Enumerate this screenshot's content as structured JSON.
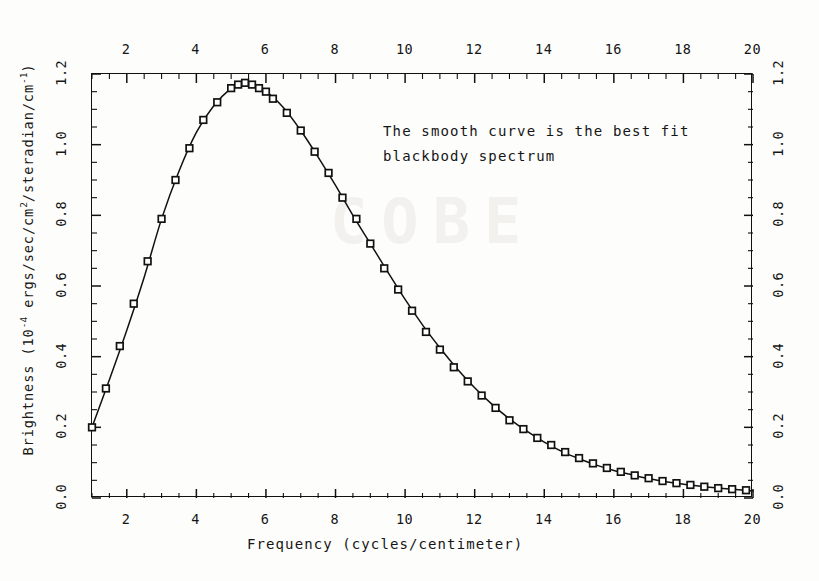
{
  "figure": {
    "xlabel": "Frequency (cycles/centimeter)",
    "ylabel_prefix": "Brightness (10",
    "ylabel_exp1": "-4",
    "ylabel_mid": " ergs/sec/cm",
    "ylabel_exp2": "2",
    "ylabel_mid2": "/steradian/cm",
    "ylabel_exp3": "-1",
    "ylabel_suffix": ")",
    "ylabel_plain": "Brightness (10⁻⁴ ergs/sec/cm²/steradian/cm⁻¹)",
    "annotation_line1": "The smooth curve is the best fit",
    "annotation_line2": "blackbody spectrum",
    "annotation_full": "The smooth curve is the best fit\nblackbody spectrum",
    "watermark": "COBE"
  },
  "chart_data": {
    "type": "line",
    "title": "",
    "subtitle": "",
    "xlabel": "Frequency (cycles/centimeter)",
    "ylabel": "Brightness (10^-4 ergs/sec/cm^2/steradian/cm^-1)",
    "xlim": [
      1,
      20
    ],
    "ylim": [
      0.0,
      1.2
    ],
    "grid": false,
    "legend": "none",
    "annotations": [
      {
        "text": "The smooth curve is the best fit blackbody spectrum",
        "x": 9.4,
        "y": 1.06
      }
    ],
    "axes": {
      "bottom": {
        "major_ticks": [
          2,
          4,
          6,
          8,
          10,
          12,
          14,
          16,
          18,
          20
        ],
        "tick_labels": [
          "2",
          "4",
          "6",
          "8",
          "10",
          "12",
          "14",
          "16",
          "18",
          "20"
        ],
        "minor_tick_step": 0.5,
        "labels_position": "below"
      },
      "top": {
        "major_ticks": [
          2,
          4,
          6,
          8,
          10,
          12,
          14,
          16,
          18,
          20
        ],
        "tick_labels": [
          "2",
          "4",
          "6",
          "8",
          "10",
          "12",
          "14",
          "16",
          "18",
          "20"
        ],
        "minor_tick_step": 0.5,
        "labels_position": "above"
      },
      "left": {
        "major_ticks": [
          0.0,
          0.2,
          0.4,
          0.6,
          0.8,
          1.0,
          1.2
        ],
        "tick_labels": [
          "0.0",
          "0.2",
          "0.4",
          "0.6",
          "0.8",
          "1.0",
          "1.2"
        ],
        "minor_tick_step": 0.05,
        "labels_rotated": true
      },
      "right": {
        "major_ticks": [
          0.0,
          0.2,
          0.4,
          0.6,
          0.8,
          1.0,
          1.2
        ],
        "tick_labels": [
          "0.0",
          "0.2",
          "0.4",
          "0.6",
          "0.8",
          "1.0",
          "1.2"
        ],
        "minor_tick_step": 0.05,
        "labels_rotated": true
      }
    },
    "series": [
      {
        "name": "FIRAS measurements",
        "marker": "open-square",
        "x": [
          1.0,
          1.4,
          1.8,
          2.2,
          2.6,
          3.0,
          3.4,
          3.8,
          4.2,
          4.6,
          5.0,
          5.2,
          5.4,
          5.6,
          5.8,
          6.0,
          6.2,
          6.6,
          7.0,
          7.4,
          7.8,
          8.2,
          8.6,
          9.0,
          9.4,
          9.8,
          10.2,
          10.6,
          11.0,
          11.4,
          11.8,
          12.2,
          12.6,
          13.0,
          13.4,
          13.8,
          14.2,
          14.6,
          15.0,
          15.4,
          15.8,
          16.2,
          16.6,
          17.0,
          17.4,
          17.8,
          18.2,
          18.6,
          19.0,
          19.4,
          19.8
        ],
        "y": [
          0.2,
          0.31,
          0.43,
          0.55,
          0.67,
          0.79,
          0.9,
          0.99,
          1.07,
          1.12,
          1.16,
          1.17,
          1.175,
          1.17,
          1.16,
          1.15,
          1.13,
          1.09,
          1.04,
          0.98,
          0.92,
          0.85,
          0.79,
          0.72,
          0.65,
          0.59,
          0.53,
          0.47,
          0.42,
          0.37,
          0.33,
          0.29,
          0.255,
          0.22,
          0.195,
          0.17,
          0.15,
          0.13,
          0.113,
          0.098,
          0.085,
          0.074,
          0.064,
          0.056,
          0.048,
          0.042,
          0.037,
          0.032,
          0.028,
          0.025,
          0.022
        ]
      },
      {
        "name": "best fit blackbody spectrum",
        "marker": "none",
        "style": "smooth-line",
        "x": [
          1.0,
          1.5,
          2.0,
          2.5,
          3.0,
          3.5,
          4.0,
          4.5,
          5.0,
          5.3,
          5.5,
          6.0,
          6.5,
          7.0,
          7.5,
          8.0,
          8.5,
          9.0,
          9.5,
          10.0,
          10.5,
          11.0,
          11.5,
          12.0,
          12.5,
          13.0,
          13.5,
          14.0,
          14.5,
          15.0,
          15.5,
          16.0,
          16.5,
          17.0,
          17.5,
          18.0,
          18.5,
          19.0,
          19.5,
          20.0
        ],
        "y": [
          0.2,
          0.335,
          0.475,
          0.625,
          0.79,
          0.925,
          1.035,
          1.11,
          1.16,
          1.175,
          1.172,
          1.15,
          1.105,
          1.04,
          0.965,
          0.885,
          0.8,
          0.72,
          0.64,
          0.562,
          0.49,
          0.425,
          0.365,
          0.312,
          0.265,
          0.224,
          0.189,
          0.158,
          0.132,
          0.111,
          0.093,
          0.078,
          0.066,
          0.055,
          0.046,
          0.039,
          0.033,
          0.028,
          0.024,
          0.02
        ]
      }
    ]
  }
}
